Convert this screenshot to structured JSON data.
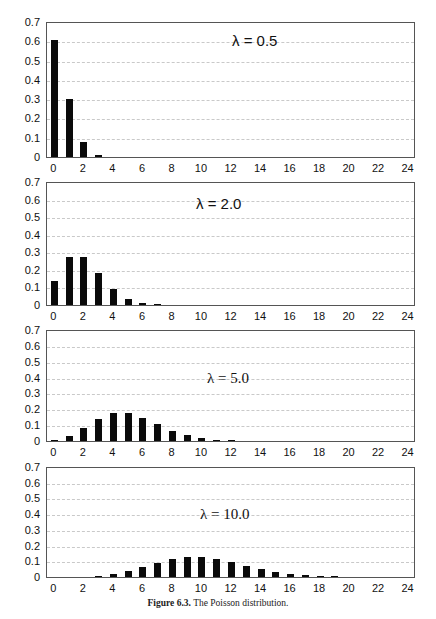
{
  "caption": {
    "label": "Figure 6.3.",
    "text": "The Poisson distribution."
  },
  "legend": {
    "line1": "Horizontal Axis: k",
    "line2": "Vertical Axis: P[Y=k]",
    "line3": "Y Poisson, mean λ"
  },
  "axes": {
    "yticks": [
      "0.7",
      "0.6",
      "0.5",
      "0.4",
      "0.3",
      "0.2",
      "0.1",
      "0"
    ],
    "xticks": [
      "0",
      "2",
      "4",
      "6",
      "8",
      "10",
      "12",
      "14",
      "16",
      "18",
      "20",
      "22",
      "24"
    ]
  },
  "panels": [
    {
      "label": "λ = 0.5"
    },
    {
      "label": "λ = 2.0"
    },
    {
      "label": "λ = 5.0"
    },
    {
      "label": "λ = 10.0"
    }
  ],
  "chart_data": [
    {
      "type": "bar",
      "title": "λ = 0.5",
      "xlabel": "k",
      "ylabel": "P[Y=k]",
      "x": [
        0,
        1,
        2,
        3,
        4,
        5,
        6,
        7,
        8,
        9,
        10,
        11,
        12,
        13,
        14,
        15,
        16,
        17,
        18,
        19,
        20,
        21,
        22,
        23,
        24
      ],
      "values": [
        0.6065,
        0.3033,
        0.0758,
        0.0126,
        0.0016,
        0.0002,
        0,
        0,
        0,
        0,
        0,
        0,
        0,
        0,
        0,
        0,
        0,
        0,
        0,
        0,
        0,
        0,
        0,
        0,
        0
      ],
      "ylim": [
        0,
        0.7
      ],
      "xlim": [
        0,
        24
      ],
      "grid": true,
      "annotations": [
        "Horizontal Axis: k",
        "Vertical Axis: P[Y=k]",
        "Y Poisson, mean λ"
      ]
    },
    {
      "type": "bar",
      "title": "λ = 2.0",
      "xlabel": "k",
      "ylabel": "P[Y=k]",
      "x": [
        0,
        1,
        2,
        3,
        4,
        5,
        6,
        7,
        8,
        9,
        10,
        11,
        12,
        13,
        14,
        15,
        16,
        17,
        18,
        19,
        20,
        21,
        22,
        23,
        24
      ],
      "values": [
        0.1353,
        0.2707,
        0.2707,
        0.1804,
        0.0902,
        0.0361,
        0.012,
        0.0034,
        0.0009,
        0.0002,
        0,
        0,
        0,
        0,
        0,
        0,
        0,
        0,
        0,
        0,
        0,
        0,
        0,
        0,
        0
      ],
      "ylim": [
        0,
        0.7
      ],
      "xlim": [
        0,
        24
      ],
      "grid": true
    },
    {
      "type": "bar",
      "title": "λ = 5.0",
      "xlabel": "k",
      "ylabel": "P[Y=k]",
      "x": [
        0,
        1,
        2,
        3,
        4,
        5,
        6,
        7,
        8,
        9,
        10,
        11,
        12,
        13,
        14,
        15,
        16,
        17,
        18,
        19,
        20,
        21,
        22,
        23,
        24
      ],
      "values": [
        0.0067,
        0.0337,
        0.0842,
        0.1404,
        0.1755,
        0.1755,
        0.1462,
        0.1044,
        0.0653,
        0.0363,
        0.0181,
        0.0082,
        0.0034,
        0.0013,
        0.0005,
        0.0002,
        0,
        0,
        0,
        0,
        0,
        0,
        0,
        0,
        0
      ],
      "ylim": [
        0,
        0.7
      ],
      "xlim": [
        0,
        24
      ],
      "grid": true
    },
    {
      "type": "bar",
      "title": "λ = 10.0",
      "xlabel": "k",
      "ylabel": "P[Y=k]",
      "x": [
        0,
        1,
        2,
        3,
        4,
        5,
        6,
        7,
        8,
        9,
        10,
        11,
        12,
        13,
        14,
        15,
        16,
        17,
        18,
        19,
        20,
        21,
        22,
        23,
        24
      ],
      "values": [
        0.0,
        0.0005,
        0.0023,
        0.0076,
        0.0189,
        0.0378,
        0.0631,
        0.0901,
        0.1126,
        0.1251,
        0.1251,
        0.1137,
        0.0948,
        0.0729,
        0.0521,
        0.0347,
        0.0217,
        0.0128,
        0.0071,
        0.0037,
        0.0019,
        0.0009,
        0.0004,
        0.0002,
        0.0001
      ],
      "ylim": [
        0,
        0.7
      ],
      "xlim": [
        0,
        24
      ],
      "grid": true
    }
  ]
}
